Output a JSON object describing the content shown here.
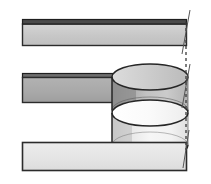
{
  "figure": {
    "name": "lap-joint-cylindrical-fastener-section",
    "title": "",
    "caption": "",
    "background_color": "#ffffff",
    "width": 211,
    "height": 184
  },
  "palette": {
    "outline": "#2b2b2b",
    "outline_heavy": "#1a1a1a",
    "top_plate_fill": "#c9c9c9",
    "top_plate_edge_fill": "#4a4a4a",
    "middle_plate_fill": "#a9a9a9",
    "middle_plate_edge_fill": "#6e6e6e",
    "bottom_plate_fill": "#e3e3e3",
    "cylinder_upper_fill": "#bdbdbd",
    "cylinder_upper_shadow_fill": "#8f8f8f",
    "cylinder_lower_fill": "#f2f2f2",
    "cylinder_lower_shadow_fill": "#d6d6d6",
    "ellipse_top_fill": "#cfcfcf",
    "ellipse_bottom_fill": "#fafafa",
    "dashed_line": "#3a3a3a",
    "axis_line": "#555555"
  },
  "parts": [
    {
      "id": "top-plate",
      "label": "top plate",
      "fill": "#c9c9c9",
      "x": 22,
      "y": 19,
      "width": 165,
      "height": 27
    },
    {
      "id": "middle-plate",
      "label": "middle plate",
      "fill": "#a9a9a9",
      "x": 22,
      "y": 73,
      "width": 165,
      "height": 30
    },
    {
      "id": "bottom-plate",
      "label": "bottom plate",
      "fill": "#e3e3e3",
      "x": 22,
      "y": 141,
      "width": 165,
      "height": 31
    },
    {
      "id": "cylinder-upper",
      "label": "upper cylinder segment",
      "fill": "#bdbdbd",
      "cx": 150,
      "rx": 38,
      "ry": 13,
      "top_y": 77,
      "bottom_y": 110
    },
    {
      "id": "cylinder-lower",
      "label": "lower cylinder segment",
      "fill": "#f2f2f2",
      "cx": 150,
      "rx": 38,
      "ry": 13,
      "top_y": 113,
      "bottom_y": 145
    }
  ],
  "annotations": {
    "dashed_centerline": {
      "label": "dashed centerline",
      "x": 186,
      "y_start": 22,
      "y_end": 150,
      "dash": "3 3"
    },
    "axis_tick_upper": {
      "label": "upper axis tick",
      "x1": 190,
      "y1": 10,
      "x2": 182,
      "y2": 54
    },
    "axis_tick_lower": {
      "label": "lower axis tick",
      "x1": 190,
      "y1": 64,
      "x2": 182,
      "y2": 108
    },
    "axis_tick_bottom": {
      "label": "bottom axis tick",
      "x1": 189,
      "y1": 130,
      "x2": 183,
      "y2": 168
    }
  }
}
